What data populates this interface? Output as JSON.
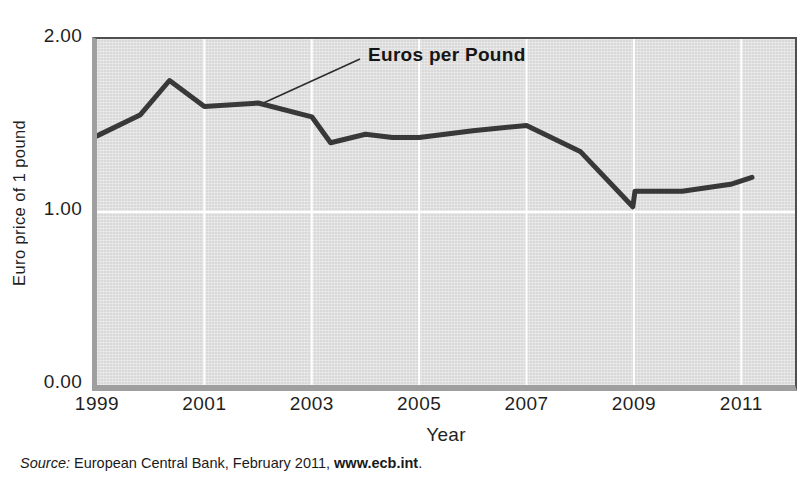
{
  "figure": {
    "annotation": "Euros per Pound",
    "source": {
      "label": "Source:",
      "body": " European Central Bank, February 2011, ",
      "link": "www.ecb.int",
      "suffix": "."
    }
  },
  "chart_data": {
    "type": "line",
    "xlabel": "Year",
    "ylabel": "Euro price of 1 pound",
    "xlim": [
      1999,
      2012
    ],
    "ylim": [
      0,
      2
    ],
    "x_ticks": [
      {
        "label": "1999",
        "year": 1999
      },
      {
        "label": "2001",
        "year": 2001
      },
      {
        "label": "2003",
        "year": 2003
      },
      {
        "label": "2005",
        "year": 2005
      },
      {
        "label": "2007",
        "year": 2007
      },
      {
        "label": "2009",
        "year": 2009
      },
      {
        "label": "2011",
        "year": 2011
      }
    ],
    "y_ticks": [
      {
        "label": "2.00",
        "value": 2
      },
      {
        "label": "1.00",
        "value": 1
      },
      {
        "label": "0.00",
        "value": 0
      }
    ],
    "x_gridlines": [
      2001,
      2003,
      2005,
      2007,
      2009,
      2011
    ],
    "y_gridlines": [
      1.0
    ],
    "grid": true,
    "annotation_anchor": {
      "year": 2002.1,
      "value": 1.63
    },
    "series": [
      {
        "name": "Euros per Pound",
        "points": [
          [
            1999.0,
            1.44
          ],
          [
            1999.8,
            1.56
          ],
          [
            2000.35,
            1.76
          ],
          [
            2001.0,
            1.61
          ],
          [
            2002.0,
            1.63
          ],
          [
            2003.0,
            1.55
          ],
          [
            2003.35,
            1.4
          ],
          [
            2004.0,
            1.45
          ],
          [
            2004.5,
            1.43
          ],
          [
            2005.0,
            1.43
          ],
          [
            2006.0,
            1.47
          ],
          [
            2007.0,
            1.5
          ],
          [
            2008.0,
            1.35
          ],
          [
            2008.98,
            1.03
          ],
          [
            2009.02,
            1.12
          ],
          [
            2009.9,
            1.12
          ],
          [
            2010.8,
            1.16
          ],
          [
            2011.2,
            1.2
          ]
        ]
      }
    ],
    "colors": {
      "line": "#383838",
      "plot_bg": "#d9d9d9",
      "grid": "#ffffff",
      "axis_band": "#9f9f9f",
      "border": "#4f4f4f",
      "leader_line": "#2b2b2b"
    }
  }
}
